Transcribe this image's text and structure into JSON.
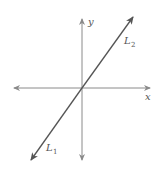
{
  "diagram": {
    "axes": {
      "x_label": "x",
      "y_label": "y",
      "color": "#8a8a8a"
    },
    "lines": [
      {
        "name": "L",
        "subscript": "1",
        "position": "lower-left"
      },
      {
        "name": "L",
        "subscript": "2",
        "position": "upper-right"
      }
    ],
    "line_color": "#5a5a5a",
    "note": "Two coincident lines L1 and L2 passing through the origin"
  }
}
